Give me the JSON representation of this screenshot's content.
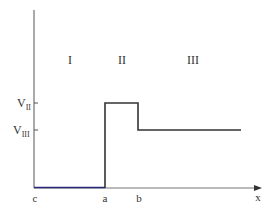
{
  "diagram": {
    "type": "potential-step",
    "regions": [
      {
        "label": "I"
      },
      {
        "label": "II"
      },
      {
        "label": "III"
      }
    ],
    "y_ticks": [
      {
        "base": "V",
        "sub": "II"
      },
      {
        "base": "V",
        "sub": "III"
      }
    ],
    "x_ticks": [
      {
        "label": "c"
      },
      {
        "label": "a"
      },
      {
        "label": "b"
      }
    ],
    "x_axis_label": "x",
    "colors": {
      "axis": "#555555",
      "potential": "#333333",
      "ground_segment": "#2a2a7a"
    }
  }
}
